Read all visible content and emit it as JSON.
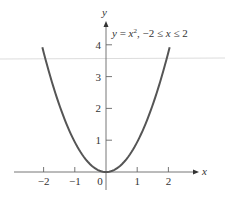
{
  "chart_data": {
    "type": "line",
    "title": "",
    "annotation": {
      "lhs": "y",
      "eq": " = ",
      "var": "x",
      "exp": "2",
      "domain_sep": ",  −2 ≤ ",
      "domain_var": "x",
      "domain_end": " ≤ 2"
    },
    "function": "y = x^2",
    "domain": [
      -2,
      2
    ],
    "xlabel": "x",
    "ylabel": "y",
    "x_ticks": [
      -2,
      -1,
      0,
      1,
      2
    ],
    "x_tick_labels": [
      "−2",
      "−1",
      "0",
      "1",
      "2"
    ],
    "y_ticks": [
      1,
      2,
      3,
      4
    ],
    "y_tick_labels": [
      "1",
      "2",
      "3",
      "4"
    ],
    "xlim": [
      -2.8,
      2.95
    ],
    "ylim": [
      -0.6,
      4.8
    ],
    "grid": false,
    "legend": "none",
    "series": [
      {
        "name": "y = x^2",
        "x": [
          -2,
          -1.5,
          -1,
          -0.5,
          0,
          0.5,
          1,
          1.5,
          2
        ],
        "y": [
          4,
          2.25,
          1,
          0.25,
          0,
          0.25,
          1,
          2.25,
          4
        ],
        "color": "#555555"
      }
    ],
    "colors": {
      "curve": "#555555",
      "axes": "#666666",
      "text": "#333333",
      "artifact_line": "#d8d8d8"
    }
  }
}
